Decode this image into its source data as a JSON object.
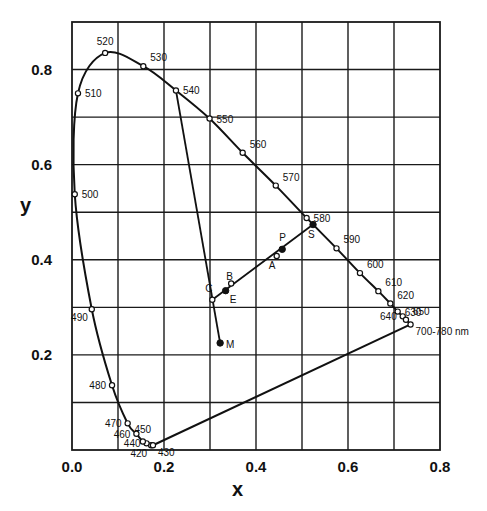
{
  "chart_data": {
    "type": "scatter",
    "title": "",
    "xlabel": "x",
    "ylabel": "y",
    "xlim": [
      0.0,
      0.8
    ],
    "ylim": [
      0.0,
      0.9
    ],
    "grid": true,
    "x_ticks": [
      {
        "value": 0.0,
        "label": "0.0"
      },
      {
        "value": 0.2,
        "label": "0.2"
      },
      {
        "value": 0.4,
        "label": "0.4"
      },
      {
        "value": 0.6,
        "label": "0.6"
      },
      {
        "value": 0.8,
        "label": "0.8"
      }
    ],
    "y_ticks": [
      {
        "value": 0.2,
        "label": "0.2"
      },
      {
        "value": 0.4,
        "label": "0.4"
      },
      {
        "value": 0.6,
        "label": "0.6"
      },
      {
        "value": 0.8,
        "label": "0.8"
      }
    ],
    "grid_step": 0.1,
    "spectral_locus": [
      {
        "nm": "420",
        "label": "420",
        "x": 0.172,
        "y": 0.01,
        "label_pos": "below-left"
      },
      {
        "nm": "430",
        "label": "430",
        "x": 0.176,
        "y": 0.01,
        "label_pos": "below-right"
      },
      {
        "nm": "440",
        "label": "440",
        "x": 0.162,
        "y": 0.014,
        "label_pos": "left"
      },
      {
        "nm": "450",
        "label": "450",
        "x": 0.154,
        "y": 0.018,
        "label_pos": "above"
      },
      {
        "nm": "460",
        "label": "460",
        "x": 0.14,
        "y": 0.034,
        "label_pos": "left"
      },
      {
        "nm": "470",
        "label": "470",
        "x": 0.121,
        "y": 0.056,
        "label_pos": "left"
      },
      {
        "nm": "480",
        "label": "480",
        "x": 0.087,
        "y": 0.136,
        "label_pos": "left"
      },
      {
        "nm": "490",
        "label": "490",
        "x": 0.043,
        "y": 0.296,
        "label_pos": "below-left"
      },
      {
        "nm": "500",
        "label": "500",
        "x": 0.006,
        "y": 0.538,
        "label_pos": "right"
      },
      {
        "nm": "510",
        "label": "510",
        "x": 0.013,
        "y": 0.75,
        "label_pos": "right"
      },
      {
        "nm": "520",
        "label": "520",
        "x": 0.072,
        "y": 0.835,
        "label_pos": "above"
      },
      {
        "nm": "530",
        "label": "530",
        "x": 0.155,
        "y": 0.807,
        "label_pos": "above-right"
      },
      {
        "nm": "540",
        "label": "540",
        "x": 0.226,
        "y": 0.756,
        "label_pos": "right"
      },
      {
        "nm": "550",
        "label": "550",
        "x": 0.299,
        "y": 0.697,
        "label_pos": "right"
      },
      {
        "nm": "560",
        "label": "560",
        "x": 0.371,
        "y": 0.625,
        "label_pos": "above-right"
      },
      {
        "nm": "570",
        "label": "570",
        "x": 0.443,
        "y": 0.556,
        "label_pos": "above-right"
      },
      {
        "nm": "580",
        "label": "580",
        "x": 0.51,
        "y": 0.488,
        "label_pos": "right"
      },
      {
        "nm": "590",
        "label": "590",
        "x": 0.575,
        "y": 0.424,
        "label_pos": "above-right"
      },
      {
        "nm": "600",
        "label": "600",
        "x": 0.626,
        "y": 0.372,
        "label_pos": "above-right"
      },
      {
        "nm": "610",
        "label": "610",
        "x": 0.666,
        "y": 0.334,
        "label_pos": "above-right"
      },
      {
        "nm": "620",
        "label": "620",
        "x": 0.692,
        "y": 0.308,
        "label_pos": "above-right"
      },
      {
        "nm": "630",
        "label": "630",
        "x": 0.708,
        "y": 0.291,
        "label_pos": "right"
      },
      {
        "nm": "640",
        "label": "640",
        "x": 0.719,
        "y": 0.281,
        "label_pos": "left"
      },
      {
        "nm": "650",
        "label": "650",
        "x": 0.726,
        "y": 0.274,
        "label_pos": "above-right"
      },
      {
        "nm": "700-780",
        "label": "700-780 nm",
        "x": 0.736,
        "y": 0.264,
        "label_pos": "below-right"
      }
    ],
    "points": [
      {
        "id": "M",
        "label": "M",
        "x": 0.322,
        "y": 0.225,
        "marker": "filled"
      },
      {
        "id": "C",
        "label": "C",
        "x": 0.305,
        "y": 0.316,
        "marker": "open"
      },
      {
        "id": "E",
        "label": "E",
        "x": 0.334,
        "y": 0.335,
        "marker": "filled"
      },
      {
        "id": "B",
        "label": "B",
        "x": 0.346,
        "y": 0.35,
        "marker": "open"
      },
      {
        "id": "A",
        "label": "A",
        "x": 0.445,
        "y": 0.408,
        "marker": "open"
      },
      {
        "id": "P",
        "label": "P",
        "x": 0.457,
        "y": 0.422,
        "marker": "filled"
      },
      {
        "id": "S",
        "label": "S",
        "x": 0.524,
        "y": 0.474,
        "marker": "filled"
      }
    ],
    "construction_lines": [
      {
        "from": "540",
        "to": "M"
      },
      {
        "from": "C",
        "to": "S"
      }
    ],
    "purple_line": {
      "from": "430",
      "to": "700-780"
    }
  }
}
